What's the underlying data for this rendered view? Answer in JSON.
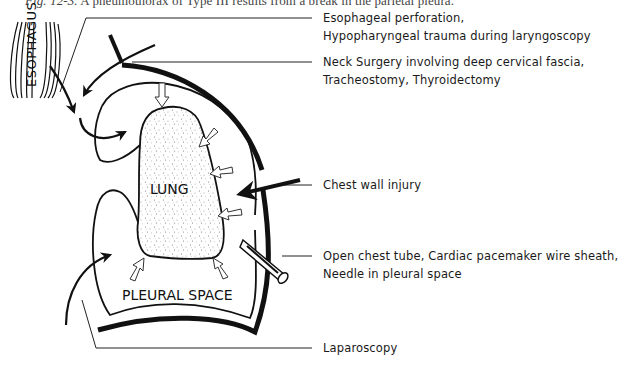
{
  "caption": {
    "fig_label": "Fig. 12-3.",
    "text": " A pneumothorax of Type III results from a break in the parietal pleura."
  },
  "diagram": {
    "structures": {
      "esophagus": "ESOPHAGUS",
      "lung": "LUNG",
      "pleural_space": "PLEURAL SPACE"
    },
    "callouts": [
      {
        "id": "esophageal",
        "lines": [
          "Esophageal perforation,",
          "Hypopharyngeal trauma during laryngoscopy"
        ]
      },
      {
        "id": "neck",
        "lines": [
          "Neck Surgery involving deep cervical fascia,",
          "Tracheostomy, Thyroidectomy"
        ]
      },
      {
        "id": "chest-wall",
        "lines": [
          "Chest wall injury"
        ]
      },
      {
        "id": "chest-tube",
        "lines": [
          "Open chest tube, Cardiac  pacemaker wire sheath,",
          "Needle in pleural space"
        ]
      },
      {
        "id": "laparoscopy",
        "lines": [
          "Laparoscopy"
        ]
      }
    ]
  }
}
